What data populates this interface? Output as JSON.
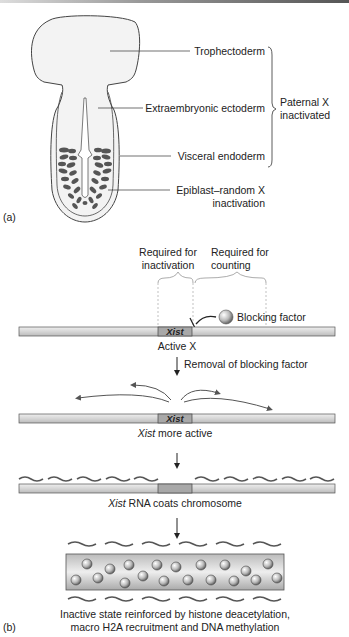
{
  "panel_a": {
    "tag": "(a)",
    "labels": {
      "trophectoderm": "Trophectoderm",
      "extraembryonic": "Extraembryonic ectoderm",
      "visceral": "Visceral endoderm",
      "epiblast_1": "Epiblast–random X",
      "epiblast_2": "inactivation"
    },
    "bracket_label_1": "Paternal X",
    "bracket_label_2": "inactivated"
  },
  "panel_b": {
    "tag": "(b)",
    "required_inactivation_1": "Required for",
    "required_inactivation_2": "inactivation",
    "required_counting_1": "Required for",
    "required_counting_2": "counting",
    "blocking_factor": "Blocking factor",
    "xist": "Xist",
    "active_x": "Active X",
    "removal": "Removal of blocking factor",
    "xist_more_active_italic": "Xist",
    "xist_more_active_rest": " more active",
    "coats_italic": "Xist",
    "coats_rest": " RNA coats chromosome",
    "final_1": "Inactive state reinforced by histone deacetylation,",
    "final_2": "macro H2A recruitment and DNA methylation"
  },
  "colors": {
    "chromosome": "#d8d8d8",
    "xist_region": "#a8a8a8",
    "cell_dark": "#555555",
    "embryo_fill": "#f2f2f2"
  }
}
